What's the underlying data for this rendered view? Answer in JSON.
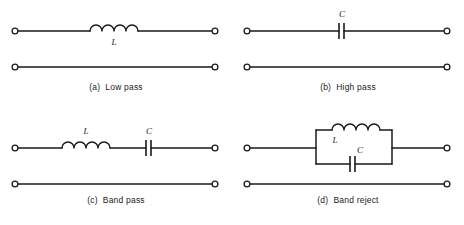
{
  "figure": {
    "background_color": "#ffffff",
    "line_color": "#1a1a1a"
  },
  "panels": [
    {
      "id": "a",
      "caption": "(a)  Low pass",
      "topology": "series-inductor-shunt",
      "components": [
        {
          "type": "inductor",
          "label": "L",
          "label_position": "below",
          "turns": 4
        }
      ],
      "terminals": 4,
      "lines": [
        "top-wire",
        "bottom-wire"
      ]
    },
    {
      "id": "b",
      "caption": "(b)  High pass",
      "topology": "series-capacitor",
      "components": [
        {
          "type": "capacitor",
          "label": "C",
          "label_position": "above"
        }
      ],
      "terminals": 4,
      "lines": [
        "top-wire",
        "bottom-wire"
      ]
    },
    {
      "id": "c",
      "caption": "(c)  Band pass",
      "topology": "series-lc",
      "components": [
        {
          "type": "inductor",
          "label": "L",
          "label_position": "above",
          "turns": 4
        },
        {
          "type": "capacitor",
          "label": "C",
          "label_position": "above"
        }
      ],
      "terminals": 4,
      "lines": [
        "top-wire",
        "bottom-wire"
      ]
    },
    {
      "id": "d",
      "caption": "(d)  Band reject",
      "topology": "parallel-lc-tank",
      "components": [
        {
          "type": "inductor",
          "label": "L",
          "label_position": "below",
          "turns": 4,
          "branch": "upper"
        },
        {
          "type": "capacitor",
          "label": "C",
          "label_position": "above",
          "branch": "lower"
        }
      ],
      "terminals": 4,
      "lines": [
        "top-wire",
        "bottom-wire",
        "tank-rectangle"
      ]
    }
  ]
}
